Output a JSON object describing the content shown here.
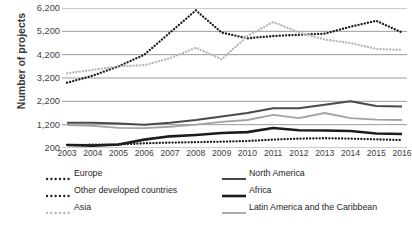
{
  "chart_data": {
    "type": "line",
    "title": "",
    "xlabel": "",
    "ylabel": "Number of projects",
    "x": [
      2003,
      2004,
      2005,
      2006,
      2007,
      2008,
      2009,
      2010,
      2011,
      2012,
      2013,
      2014,
      2015,
      2016
    ],
    "categories": [
      "2003",
      "2004",
      "2005",
      "2006",
      "2007",
      "2008",
      "2009",
      "2010",
      "2011",
      "2012",
      "2013",
      "2014",
      "2015",
      "2016"
    ],
    "ylim": [
      200,
      6200
    ],
    "yticks": [
      200,
      1200,
      2200,
      3200,
      4200,
      5200,
      6200
    ],
    "ytick_labels": [
      "200",
      "1,200",
      "2,200",
      "3,200",
      "4,200",
      "5,200",
      "6,200"
    ],
    "grid": true,
    "legend_position": "bottom",
    "series": [
      {
        "name": "Europe",
        "style": "dotted",
        "color": "#1c1c1c",
        "values": [
          3000,
          3300,
          3700,
          4200,
          5150,
          6100,
          5150,
          4900,
          5000,
          5050,
          5100,
          5400,
          5650,
          5150
        ]
      },
      {
        "name": "Other developed countries",
        "style": "dotted",
        "color": "#1c1c1c",
        "values": [
          330,
          340,
          350,
          400,
          430,
          450,
          470,
          500,
          560,
          600,
          620,
          600,
          570,
          540
        ]
      },
      {
        "name": "Asia",
        "style": "dotted",
        "color": "#b5b5b5",
        "values": [
          3400,
          3550,
          3700,
          3750,
          4050,
          4500,
          4000,
          5000,
          5600,
          5150,
          4850,
          4700,
          4450,
          4400
        ]
      },
      {
        "name": "North America",
        "style": "solid-medium",
        "color": "#4a4a4a",
        "values": [
          1280,
          1280,
          1250,
          1200,
          1280,
          1400,
          1550,
          1700,
          1900,
          1900,
          2050,
          2200,
          2000,
          1980
        ]
      },
      {
        "name": "Africa",
        "style": "solid-bold",
        "color": "#1c1c1c",
        "values": [
          330,
          300,
          350,
          560,
          700,
          760,
          840,
          880,
          1060,
          960,
          950,
          930,
          820,
          800
        ]
      },
      {
        "name": "Latin America and the Caribbean",
        "style": "solid-light",
        "color": "#a3a3a3",
        "values": [
          1180,
          1150,
          1060,
          1050,
          1110,
          1200,
          1320,
          1400,
          1620,
          1480,
          1700,
          1480,
          1420,
          1400
        ]
      }
    ]
  },
  "legend": {
    "items": [
      {
        "label": "Europe",
        "style": "dotted",
        "color": "#1c1c1c",
        "column": "left",
        "row": 0
      },
      {
        "label": "Other developed countries",
        "style": "dotted",
        "color": "#1c1c1c",
        "column": "left",
        "row": 1
      },
      {
        "label": "Asia",
        "style": "dotted",
        "color": "#b5b5b5",
        "column": "left",
        "row": 2
      },
      {
        "label": "North America",
        "style": "solid-medium",
        "color": "#4a4a4a",
        "column": "right",
        "row": 0
      },
      {
        "label": "Africa",
        "style": "solid-bold",
        "color": "#1c1c1c",
        "column": "right",
        "row": 1
      },
      {
        "label": "Latin America and the Caribbean",
        "style": "solid-light",
        "color": "#a3a3a3",
        "column": "right",
        "row": 2
      }
    ]
  },
  "axis": {
    "y_label": "Number of projects",
    "gridline_color": "#9a9a9a"
  }
}
